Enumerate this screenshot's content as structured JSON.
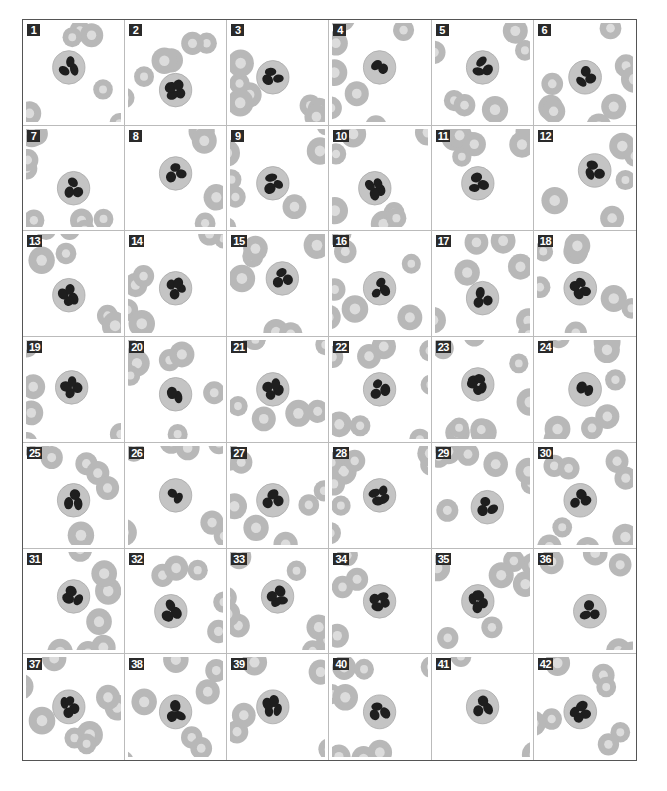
{
  "figure": {
    "rows": 7,
    "columns": 6,
    "colors": {
      "rbc": "#b8b8b8",
      "rbc_center": "#dcdcdc",
      "cytoplasm": "#c4c4c4",
      "nucleus": "#1e1e1e",
      "label_bg": "#2a2a2a",
      "label_text": "#ffffff",
      "border": "#555555"
    },
    "panels": [
      {
        "label": "1",
        "cx": 0.45,
        "cy": 0.45,
        "lobes": 3
      },
      {
        "label": "2",
        "cx": 0.5,
        "cy": 0.68,
        "lobes": 4
      },
      {
        "label": "3",
        "cx": 0.45,
        "cy": 0.55,
        "lobes": 3
      },
      {
        "label": "4",
        "cx": 0.5,
        "cy": 0.45,
        "lobes": 2
      },
      {
        "label": "5",
        "cx": 0.5,
        "cy": 0.45,
        "lobes": 3
      },
      {
        "label": "6",
        "cx": 0.5,
        "cy": 0.55,
        "lobes": 3
      },
      {
        "label": "7",
        "cx": 0.5,
        "cy": 0.6,
        "lobes": 3
      },
      {
        "label": "8",
        "cx": 0.5,
        "cy": 0.45,
        "lobes": 3
      },
      {
        "label": "9",
        "cx": 0.45,
        "cy": 0.55,
        "lobes": 3
      },
      {
        "label": "10",
        "cx": 0.45,
        "cy": 0.6,
        "lobes": 4
      },
      {
        "label": "11",
        "cx": 0.45,
        "cy": 0.55,
        "lobes": 3
      },
      {
        "label": "12",
        "cx": 0.6,
        "cy": 0.42,
        "lobes": 3
      },
      {
        "label": "13",
        "cx": 0.45,
        "cy": 0.62,
        "lobes": 4
      },
      {
        "label": "14",
        "cx": 0.5,
        "cy": 0.55,
        "lobes": 4
      },
      {
        "label": "15",
        "cx": 0.55,
        "cy": 0.45,
        "lobes": 3
      },
      {
        "label": "16",
        "cx": 0.5,
        "cy": 0.55,
        "lobes": 3
      },
      {
        "label": "17",
        "cx": 0.5,
        "cy": 0.65,
        "lobes": 3
      },
      {
        "label": "18",
        "cx": 0.45,
        "cy": 0.55,
        "lobes": 4
      },
      {
        "label": "19",
        "cx": 0.48,
        "cy": 0.48,
        "lobes": 4
      },
      {
        "label": "20",
        "cx": 0.5,
        "cy": 0.55,
        "lobes": 2
      },
      {
        "label": "21",
        "cx": 0.45,
        "cy": 0.5,
        "lobes": 4
      },
      {
        "label": "22",
        "cx": 0.5,
        "cy": 0.5,
        "lobes": 3
      },
      {
        "label": "23",
        "cx": 0.45,
        "cy": 0.45,
        "lobes": 5
      },
      {
        "label": "24",
        "cx": 0.5,
        "cy": 0.5,
        "lobes": 2
      },
      {
        "label": "25",
        "cx": 0.5,
        "cy": 0.55,
        "lobes": 3
      },
      {
        "label": "26",
        "cx": 0.5,
        "cy": 0.5,
        "lobes": 2
      },
      {
        "label": "27",
        "cx": 0.45,
        "cy": 0.55,
        "lobes": 3
      },
      {
        "label": "28",
        "cx": 0.5,
        "cy": 0.5,
        "lobes": 4
      },
      {
        "label": "29",
        "cx": 0.55,
        "cy": 0.62,
        "lobes": 3
      },
      {
        "label": "30",
        "cx": 0.45,
        "cy": 0.55,
        "lobes": 3
      },
      {
        "label": "31",
        "cx": 0.5,
        "cy": 0.45,
        "lobes": 3
      },
      {
        "label": "32",
        "cx": 0.45,
        "cy": 0.6,
        "lobes": 3
      },
      {
        "label": "33",
        "cx": 0.5,
        "cy": 0.45,
        "lobes": 4
      },
      {
        "label": "34",
        "cx": 0.5,
        "cy": 0.5,
        "lobes": 4
      },
      {
        "label": "35",
        "cx": 0.45,
        "cy": 0.5,
        "lobes": 4
      },
      {
        "label": "36",
        "cx": 0.55,
        "cy": 0.6,
        "lobes": 3
      },
      {
        "label": "37",
        "cx": 0.45,
        "cy": 0.5,
        "lobes": 4
      },
      {
        "label": "38",
        "cx": 0.5,
        "cy": 0.55,
        "lobes": 3
      },
      {
        "label": "39",
        "cx": 0.45,
        "cy": 0.5,
        "lobes": 4
      },
      {
        "label": "40",
        "cx": 0.5,
        "cy": 0.55,
        "lobes": 3
      },
      {
        "label": "41",
        "cx": 0.5,
        "cy": 0.5,
        "lobes": 3
      },
      {
        "label": "42",
        "cx": 0.45,
        "cy": 0.55,
        "lobes": 4
      }
    ]
  }
}
